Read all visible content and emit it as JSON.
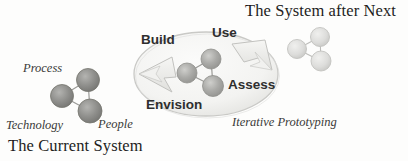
{
  "diagram": {
    "title_current": "The Current System",
    "title_future": "The System after Next",
    "caption_prototyping": "Iterative Prototyping",
    "current_system_nodes": [
      {
        "label": "Process",
        "role": "top-node-label"
      },
      {
        "label": "Technology",
        "role": "left-node-label"
      },
      {
        "label": "People",
        "role": "bottom-node-label"
      }
    ],
    "cycle_labels": [
      {
        "label": "Build",
        "position": "upper-left"
      },
      {
        "label": "Use",
        "position": "upper-right"
      },
      {
        "label": "Assess",
        "position": "lower-right"
      },
      {
        "label": "Envision",
        "position": "lower-left"
      }
    ],
    "colors": {
      "background": "#fdfdfc",
      "node_dark": "#8d8d8a",
      "node_mid": "#a9a9a6",
      "node_light": "#d8d8d6",
      "edge": "#9a9a97",
      "oval_stroke": "#c9c9c6",
      "oval_fill": "#f4f4f2",
      "arrow_fill": "#ededea",
      "arrow_stroke": "#c2c2bf",
      "text": "#2b2b2b"
    }
  }
}
